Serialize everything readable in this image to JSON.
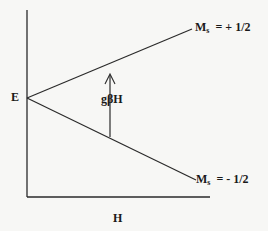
{
  "diagram": {
    "energy_label": "E",
    "field_label": "H",
    "splitting_label": "gβH",
    "upper_level": {
      "symbol": "M",
      "subscript": "s",
      "value": "= + 1/2"
    },
    "lower_level": {
      "symbol": "M",
      "subscript": "s",
      "value": "= - 1/2"
    },
    "colors": {
      "line": "#2a2a2a",
      "background": "#f7f7f5"
    }
  }
}
